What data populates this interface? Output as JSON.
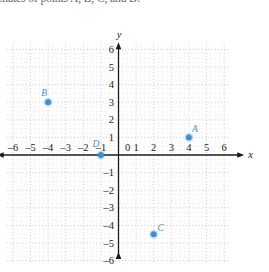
{
  "problem": {
    "text": "...nates of points A, B, C, and D."
  },
  "chart_data": {
    "type": "scatter",
    "title": "",
    "xlabel": "x",
    "ylabel": "y",
    "xlim": [
      -6.6,
      6.6
    ],
    "ylim": [
      -6.4,
      6.6
    ],
    "xticks": [
      -6,
      -5,
      -4,
      -3,
      -2,
      -1,
      0,
      1,
      2,
      3,
      4,
      5,
      6
    ],
    "yticks": [
      -6,
      -5,
      -4,
      -3,
      -2,
      -1,
      1,
      2,
      3,
      4,
      5,
      6
    ],
    "xtick_labels": [
      "–6",
      "–5",
      "–4",
      "–3",
      "–2",
      "–1",
      "0",
      "1",
      "2",
      "3",
      "4",
      "5",
      "6"
    ],
    "ytick_labels": [
      "–6",
      "–5",
      "–4",
      "–3",
      "–2",
      "–1",
      "1",
      "2",
      "3",
      "4",
      "5",
      "6"
    ],
    "grid": true,
    "grid_style": "dotted",
    "minor_grid": true,
    "legend": "none",
    "point_color": "#3f8fd0",
    "axis_color": "#1b1b1b",
    "grid_color": "#bdbdbd",
    "points": [
      {
        "label": "A",
        "x": 4,
        "y": 1,
        "label_dx": 6,
        "label_dy": -5
      },
      {
        "label": "B",
        "x": -4,
        "y": 3,
        "label_dx": -4,
        "label_dy": -6
      },
      {
        "label": "C",
        "x": 2,
        "y": -4.5,
        "label_dx": 7,
        "label_dy": -3
      },
      {
        "label": "D",
        "x": -1,
        "y": 0,
        "label_dx": -5,
        "label_dy": -8
      }
    ]
  }
}
